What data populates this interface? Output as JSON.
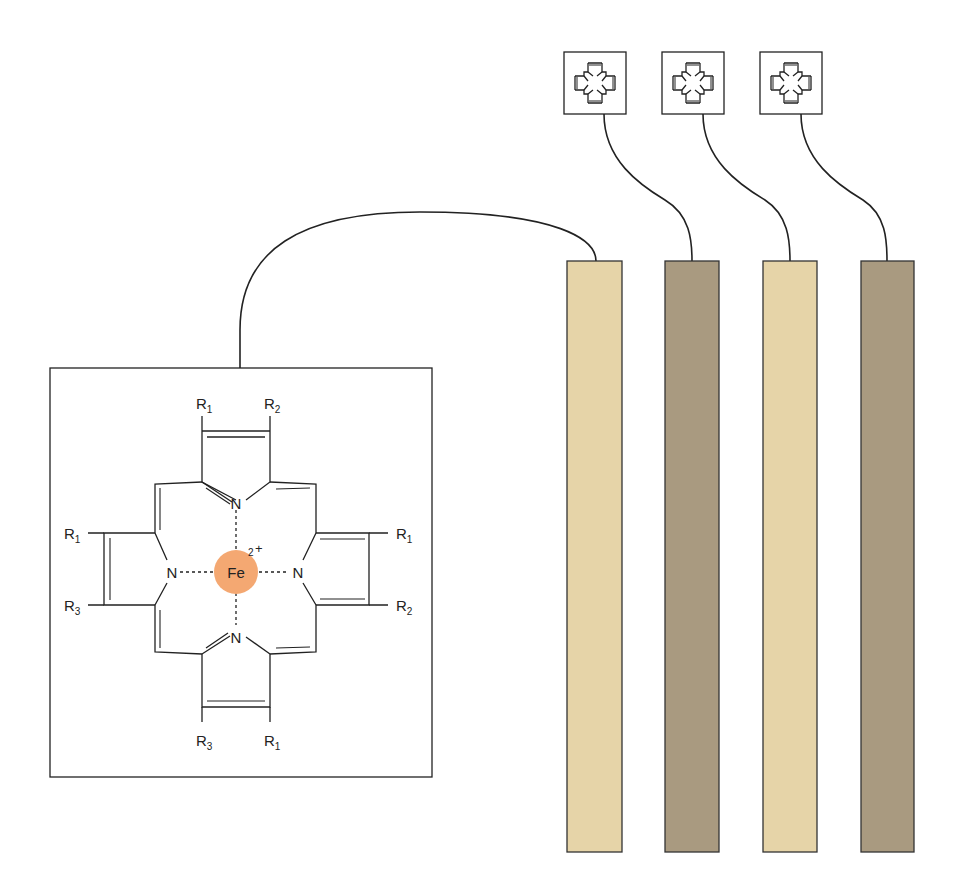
{
  "diagram": {
    "porphyrin": {
      "metal": "Fe",
      "charge_sup": "2",
      "charge_sign": "+",
      "metal_color": "#f4a872",
      "nitrogen_label": "N",
      "substituents": {
        "top_left": {
          "base": "R",
          "sub": "1"
        },
        "top_right": {
          "base": "R",
          "sub": "2"
        },
        "left_top": {
          "base": "R",
          "sub": "1"
        },
        "left_bottom": {
          "base": "R",
          "sub": "3"
        },
        "right_top": {
          "base": "R",
          "sub": "1"
        },
        "right_bottom": {
          "base": "R",
          "sub": "2"
        },
        "bottom_left": {
          "base": "R",
          "sub": "3"
        },
        "bottom_right": {
          "base": "R",
          "sub": "1"
        }
      }
    },
    "strips": [
      {
        "name": "strip-1",
        "color": "#e6d4a8"
      },
      {
        "name": "strip-2",
        "color": "#a99a80"
      },
      {
        "name": "strip-3",
        "color": "#e6d4a8"
      },
      {
        "name": "strip-4",
        "color": "#a99a80"
      }
    ],
    "mini_porphyrin_icons": 3,
    "line_color": "#222222"
  }
}
